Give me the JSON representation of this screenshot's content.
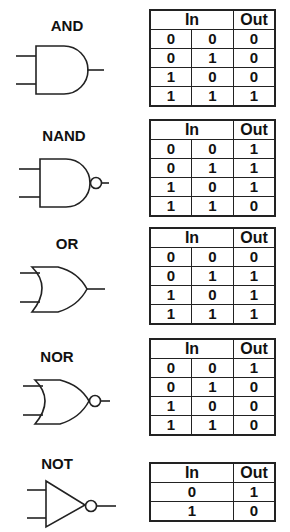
{
  "header": {
    "in": "In",
    "out": "Out"
  },
  "gates": [
    {
      "name": "AND",
      "rows": [
        [
          "0",
          "0",
          "0"
        ],
        [
          "0",
          "1",
          "0"
        ],
        [
          "1",
          "0",
          "0"
        ],
        [
          "1",
          "1",
          "1"
        ]
      ]
    },
    {
      "name": "NAND",
      "rows": [
        [
          "0",
          "0",
          "1"
        ],
        [
          "0",
          "1",
          "1"
        ],
        [
          "1",
          "0",
          "1"
        ],
        [
          "1",
          "1",
          "0"
        ]
      ]
    },
    {
      "name": "OR",
      "rows": [
        [
          "0",
          "0",
          "0"
        ],
        [
          "0",
          "1",
          "1"
        ],
        [
          "1",
          "0",
          "1"
        ],
        [
          "1",
          "1",
          "1"
        ]
      ]
    },
    {
      "name": "NOR",
      "rows": [
        [
          "0",
          "0",
          "1"
        ],
        [
          "0",
          "1",
          "0"
        ],
        [
          "1",
          "0",
          "0"
        ],
        [
          "1",
          "1",
          "0"
        ]
      ]
    },
    {
      "name": "NOT",
      "rows": [
        [
          "0",
          "1"
        ],
        [
          "1",
          "0"
        ]
      ]
    }
  ]
}
